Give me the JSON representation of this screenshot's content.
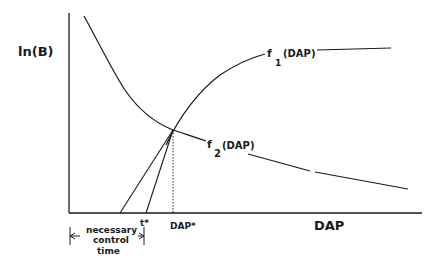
{
  "diagram": {
    "y_axis_label": "ln(B)",
    "x_axis_label": "DAP",
    "curves": [
      {
        "name": "f1",
        "label_main": "f",
        "label_sub": "1",
        "label_arg": "(DAP)",
        "description": "rising saturating curve"
      },
      {
        "name": "f2",
        "label_main": "f",
        "label_sub": "2",
        "label_arg": "(DAP)",
        "description": "decreasing curve"
      }
    ],
    "markers": {
      "t_star": "t*",
      "dap_star": "DAP*"
    },
    "annotation": {
      "line1": "necessary",
      "line2": "control",
      "line3": "time"
    },
    "colors": {
      "ink": "#1a1a1a",
      "background": "#ffffff"
    }
  }
}
